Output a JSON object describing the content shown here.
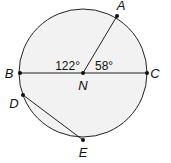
{
  "diagram": {
    "circle": {
      "center": "N",
      "cx": 83,
      "cy": 73,
      "r": 64,
      "fill": "#f2f2f2",
      "stroke": "#222222"
    },
    "points": {
      "A": {
        "label": "A",
        "x": 117,
        "y": 16,
        "lx": 121,
        "ly": 10
      },
      "B": {
        "label": "B",
        "x": 20,
        "y": 73,
        "lx": 9,
        "ly": 78
      },
      "C": {
        "label": "C",
        "x": 147,
        "y": 73,
        "lx": 154,
        "ly": 78
      },
      "N": {
        "label": "N",
        "x": 83,
        "y": 73,
        "lx": 83,
        "ly": 90
      },
      "D": {
        "label": "D",
        "x": 23,
        "y": 95,
        "lx": 14,
        "ly": 108
      },
      "E": {
        "label": "E",
        "x": 83,
        "y": 140,
        "lx": 83,
        "ly": 157
      }
    },
    "segments": [
      {
        "from": "B",
        "to": "C"
      },
      {
        "from": "N",
        "to": "A"
      },
      {
        "from": "D",
        "to": "E"
      }
    ],
    "angles": [
      {
        "label": "122°",
        "vertex": "N",
        "between": [
          "B",
          "A"
        ],
        "x": 78,
        "y": 70
      },
      {
        "label": "58°",
        "vertex": "N",
        "between": [
          "A",
          "C"
        ],
        "x": 95,
        "y": 70
      }
    ]
  }
}
